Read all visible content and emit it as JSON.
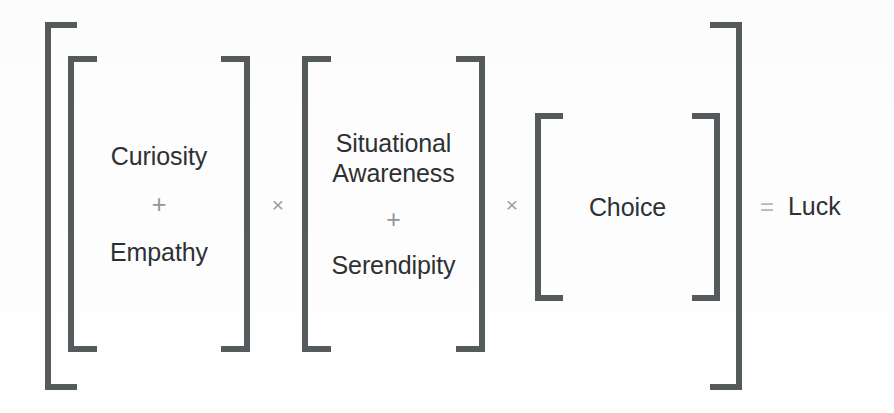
{
  "figure": {
    "type": "equation-diagram",
    "title": "",
    "colors": {
      "ink": "#555a5d",
      "text": "#2e3133",
      "operator": "#9aa0a3",
      "equals": "#b3b8bb",
      "background": "#fefefe"
    },
    "equation_plaintext": "[ [ Curiosity + Empathy ] × [ Situational Awareness + Serendipity ] × [ Choice ] ] = Luck",
    "operators": {
      "plus": "+",
      "times": "×",
      "equals": "="
    },
    "groups": [
      {
        "id": "curiosity-empathy",
        "terms": [
          "Curiosity",
          "Empathy"
        ],
        "operator": "+"
      },
      {
        "id": "awareness-serendipity",
        "terms": [
          "Situational Awareness",
          "Serendipity"
        ],
        "operator": "+"
      },
      {
        "id": "choice",
        "terms": [
          "Choice"
        ],
        "operator": ""
      }
    ],
    "result": {
      "equals": "=",
      "label": "Luck"
    },
    "terms": {
      "curiosity": "Curiosity",
      "empathy": "Empathy",
      "situational_awareness": "Situational Awareness",
      "serendipity": "Serendipity",
      "choice": "Choice",
      "luck": "Luck"
    },
    "multiply_1": "×",
    "multiply_2": "×",
    "plus_1": "+",
    "plus_2": "+"
  }
}
